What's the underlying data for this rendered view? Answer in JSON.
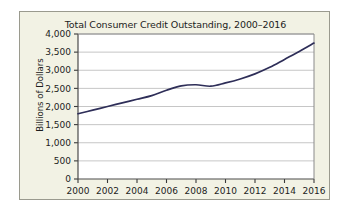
{
  "chart_data": {
    "type": "line",
    "title": "Total Consumer Credit Outstanding, 2000–2016",
    "xlabel": "",
    "ylabel": "Billions of Dollars",
    "xlim": [
      2000,
      2016
    ],
    "ylim": [
      0,
      4000
    ],
    "xticks": [
      "2000",
      "2002",
      "2004",
      "2006",
      "2008",
      "2010",
      "2012",
      "2014",
      "2016"
    ],
    "yticks": [
      "0",
      "500",
      "1,000",
      "1,500",
      "2,000",
      "2,500",
      "3,000",
      "3,500",
      "4,000"
    ],
    "grid": true,
    "legend": "none",
    "line_color": "#2e2e58",
    "plot_background": "#ffffff",
    "figure_background": "#f2f2e4",
    "x": [
      2000,
      2001,
      2002,
      2003,
      2004,
      2005,
      2006,
      2007,
      2008,
      2009,
      2010,
      2011,
      2012,
      2013,
      2014,
      2015,
      2016
    ],
    "values": [
      1800,
      1900,
      2000,
      2100,
      2200,
      2300,
      2450,
      2570,
      2600,
      2560,
      2650,
      2760,
      2900,
      3080,
      3300,
      3520,
      3750
    ],
    "series": [
      {
        "name": "Total Consumer Credit Outstanding",
        "values": [
          1800,
          1900,
          2000,
          2100,
          2200,
          2300,
          2450,
          2570,
          2600,
          2560,
          2650,
          2760,
          2900,
          3080,
          3300,
          3520,
          3750
        ]
      }
    ]
  }
}
